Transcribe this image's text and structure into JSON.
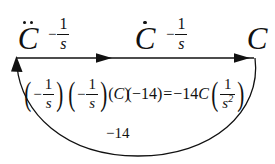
{
  "diagram": {
    "type": "signal-flow-chain",
    "title": "",
    "nodes": [
      {
        "id": "c-ddot",
        "symbol": "C",
        "accent": "double-dot",
        "meaning": "C second derivative",
        "x": 11,
        "y": 14
      },
      {
        "id": "c-dot",
        "symbol": "C",
        "accent": "single-dot",
        "meaning": "C first derivative",
        "x": 128,
        "y": 14
      },
      {
        "id": "c-plain",
        "symbol": "C",
        "accent": "none",
        "meaning": "C",
        "x": 240,
        "y": 14
      }
    ],
    "forward_gains": [
      {
        "id": "gain-1",
        "sign": "−",
        "numerator": "1",
        "denominator": "s",
        "text": "−1/s",
        "x": 48,
        "y": 14
      },
      {
        "id": "gain-2",
        "sign": "−",
        "numerator": "1",
        "denominator": "s",
        "text": "−1/s",
        "x": 166,
        "y": 14
      }
    ],
    "feedback": {
      "label": "−14",
      "direction": "right-to-left",
      "from_node": "c-plain",
      "to_node": "c-ddot"
    },
    "arrow_line": {
      "y": 58,
      "x_start": 17,
      "x_end": 255,
      "arrowhead_positions": [
        110,
        250
      ]
    }
  },
  "equation": {
    "full_text": "(−1/s)(−1/s)(C)(−14) = −14C(1/s²)",
    "lhs": {
      "factor_1": {
        "sign": "−",
        "numerator": "1",
        "denominator": "s"
      },
      "factor_2": {
        "sign": "−",
        "numerator": "1",
        "denominator": "s"
      },
      "factor_3": "C",
      "factor_4": "−14"
    },
    "relation": "=",
    "rhs": {
      "coefficient": "−14",
      "variable": "C",
      "fraction": {
        "numerator": "1",
        "denominator": "s",
        "exponent": "2"
      }
    },
    "tokens": {
      "open_paren": "(",
      "close_paren": ")",
      "minus": "−",
      "one": "1",
      "s": "s",
      "C": "C",
      "neg14": "−14",
      "equals": "=",
      "exponent_2": "2"
    }
  },
  "colors": {
    "ink": "#111111",
    "background": "#ffffff"
  }
}
